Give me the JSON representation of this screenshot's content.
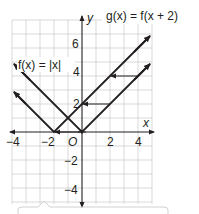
{
  "graph": {
    "axis_labels": {
      "x": "x",
      "y": "y"
    },
    "origin_label": "O",
    "x_ticks": [
      {
        "value": -4,
        "label": "−4"
      },
      {
        "value": -2,
        "label": "−2"
      },
      {
        "value": 2,
        "label": "2"
      },
      {
        "value": 4,
        "label": "4"
      }
    ],
    "y_ticks": [
      {
        "value": 6,
        "label": "6"
      },
      {
        "value": 4,
        "label": "4"
      },
      {
        "value": 2,
        "label": "2"
      },
      {
        "value": -2,
        "label": "−2"
      },
      {
        "value": -4,
        "label": "−4"
      }
    ],
    "functions": [
      {
        "name": "f",
        "label": "f(x) = |x|",
        "vertex": [
          0,
          0
        ]
      },
      {
        "name": "g",
        "label": "g(x) = f(x + 2)",
        "vertex": [
          -2,
          0
        ]
      }
    ],
    "translation_arrows": [
      {
        "from": [
          2,
          4
        ],
        "to": [
          0,
          4
        ]
      },
      {
        "from": [
          2,
          2
        ],
        "to": [
          0,
          2
        ]
      },
      {
        "from": [
          0,
          0
        ],
        "to": [
          -2,
          0
        ]
      }
    ],
    "colors": {
      "line": "#231f20",
      "grid": "#c8c8c8"
    }
  },
  "labels": {
    "f_label": "f(x) = |x|",
    "g_label": "g(x) = f(x + 2)",
    "x": "x",
    "y": "y",
    "origin": "O",
    "xt_m4": "−4",
    "xt_m2": "−2",
    "xt_2": "2",
    "xt_4": "4",
    "yt_6": "6",
    "yt_4": "4",
    "yt_2": "2",
    "yt_m2": "−2",
    "yt_m4": "−4"
  }
}
